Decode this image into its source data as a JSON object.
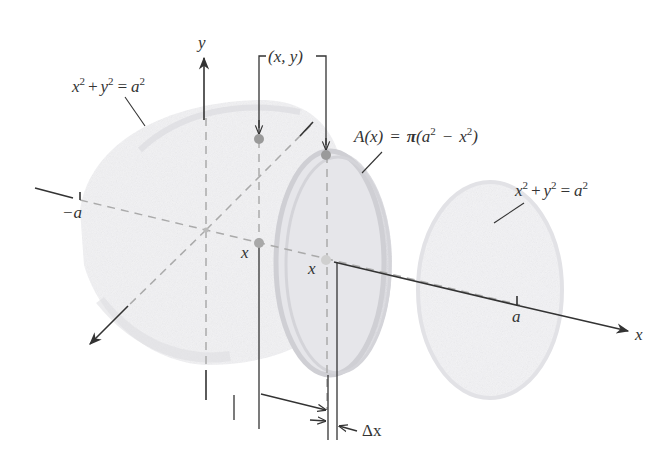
{
  "figure": {
    "type": "solid-of-revolution cross-section diagram",
    "colors": {
      "ink": "#333333",
      "solid_shade": "#e4e4e8",
      "disk_shade": "#d6d6dc",
      "disk_edge": "#c6c6cc",
      "point_dark": "#9a9a9a",
      "point_light": "#c8c8c8",
      "dashed": "#aaaaaa"
    },
    "axes": {
      "y_label": "y",
      "x_label": "x"
    },
    "labels": {
      "neg_a": "−a",
      "a": "a",
      "point_xy": "(x, y)",
      "x_left": "x",
      "x_right": "x",
      "delta_x": "Δx"
    },
    "equations": {
      "left_circle": {
        "x_term": "x",
        "plus": "+",
        "y_term": "y",
        "equals": "=",
        "rhs": "a",
        "exp": "2"
      },
      "right_circle": {
        "x_term": "x",
        "plus": "+",
        "y_term": "y",
        "equals": "=",
        "rhs": "a",
        "exp": "2"
      },
      "area": {
        "lhs": "A(x)",
        "equals": "=",
        "pi": "π",
        "open": "(",
        "a": "a",
        "minus": "−",
        "x": "x",
        "close": ")",
        "exp": "2"
      }
    }
  }
}
